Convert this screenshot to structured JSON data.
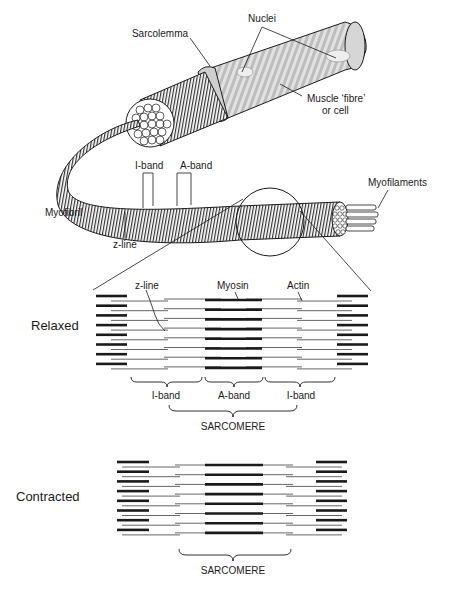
{
  "figure": {
    "top_labels": {
      "nuclei": "Nuclei",
      "sarcolemma": "Sarcolemma",
      "muscle_fibre_line1": "Muscle ‘fibre’",
      "muscle_fibre_line2": "or cell",
      "i_band": "I-band",
      "a_band": "A-band",
      "myofilaments": "Myofilaments",
      "myofibril": "Myofibril",
      "z_line": "z-line"
    },
    "relaxed": {
      "state_label": "Relaxed",
      "z_line": "z-line",
      "myosin": "Myosin",
      "actin": "Actin",
      "band_labels": [
        "I-band",
        "A-band",
        "I-band"
      ],
      "sarcomere": "SARCOMERE"
    },
    "contracted": {
      "state_label": "Contracted",
      "sarcomere": "SARCOMERE"
    }
  },
  "colors": {
    "ink": "#1a1a1a",
    "fibre_fill": "#d9d9d9",
    "fibre_stripe": "#bdbdbd",
    "thin_filament": "#555555"
  }
}
